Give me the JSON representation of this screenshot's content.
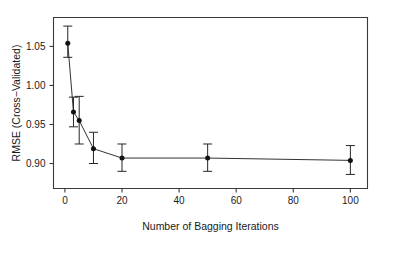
{
  "chart_data": {
    "type": "line",
    "title": "",
    "xlabel": "Number of Bagging Iterations",
    "ylabel": "RMSE (Cross−Validated)",
    "x": [
      1,
      3,
      5,
      10,
      20,
      50,
      100
    ],
    "values": [
      1.054,
      0.966,
      0.955,
      0.919,
      0.907,
      0.907,
      0.904
    ],
    "error_low": [
      1.036,
      0.947,
      0.925,
      0.9,
      0.89,
      0.89,
      0.886
    ],
    "error_high": [
      1.076,
      0.985,
      0.986,
      0.94,
      0.925,
      0.925,
      0.923
    ],
    "xlim": [
      -4,
      106
    ],
    "ylim": [
      0.868,
      1.087
    ],
    "xticks": [
      0,
      20,
      40,
      60,
      80,
      100
    ],
    "xtick_labels": [
      "0",
      "20",
      "40",
      "60",
      "80",
      "100"
    ],
    "yticks": [
      0.9,
      0.95,
      1.0,
      1.05
    ],
    "ytick_labels": [
      "0.90",
      "0.95",
      "1.00",
      "1.05"
    ],
    "grid": false,
    "legend": null,
    "marker": "filled-circle",
    "error_bar_style": "capped-vertical",
    "colors": {
      "line": "#333333",
      "marker": "#111111",
      "axis": "#3a3a3a",
      "text": "#1a1a1a",
      "background": "#ffffff"
    }
  }
}
